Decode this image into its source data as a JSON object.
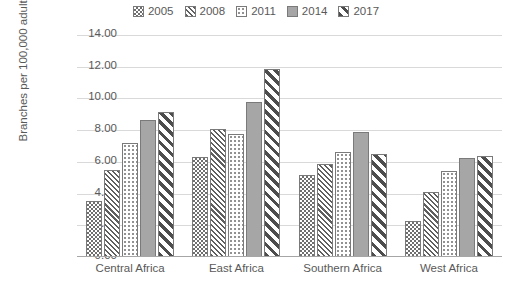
{
  "chart_data": {
    "type": "bar",
    "title": "",
    "xlabel": "",
    "ylabel": "Branches per 100,000 adults",
    "categories": [
      "Central Africa",
      "East Africa",
      "Southern Africa",
      "West Africa"
    ],
    "ylim": [
      0,
      14
    ],
    "ytick_step": 2,
    "ytick_labels": [
      "14.00",
      "12.00",
      "10.00",
      "8.00",
      "6.00",
      "4.00",
      "2.00",
      "0.00"
    ],
    "ytick_values": [
      14,
      12,
      10,
      8,
      6,
      4,
      2,
      0
    ],
    "grid": true,
    "legend_position": "top",
    "series": [
      {
        "name": "2005",
        "pattern": "checkerboard",
        "values": [
          3.55,
          6.3,
          5.15,
          2.3
        ]
      },
      {
        "name": "2008",
        "pattern": "narrow-diagonal",
        "values": [
          5.5,
          8.05,
          5.85,
          4.1
        ]
      },
      {
        "name": "2011",
        "pattern": "dotted",
        "values": [
          7.2,
          7.75,
          6.65,
          5.45
        ]
      },
      {
        "name": "2014",
        "pattern": "solid-gray",
        "values": [
          8.65,
          9.75,
          7.9,
          6.25
        ]
      },
      {
        "name": "2017",
        "pattern": "wide-diagonal",
        "values": [
          9.15,
          11.85,
          6.5,
          6.4
        ]
      }
    ]
  },
  "colors": {
    "gridline": "#d9d9d9",
    "axis": "#a6a6a6",
    "text": "#595959",
    "bar_outline": "#7a7a7a",
    "solid_fill": "#a6a6a6",
    "background": "#ffffff"
  }
}
